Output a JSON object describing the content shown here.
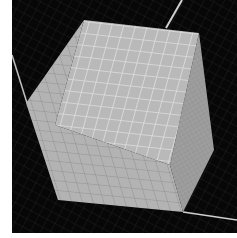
{
  "viewport": {
    "background": "#070707",
    "frame_color": "#ffffff",
    "floor_grid_color": "#1c1c1c",
    "floor_edge_color": "#bdbdbd"
  },
  "cube": {
    "grid_divisions": 10,
    "top_face": {
      "fill": "#b9b9b9",
      "grid_color": "#dedede",
      "points": "84,20 199,33 170,165 55,125"
    },
    "left_face": {
      "fill": "#b3b3b3",
      "grid_color": "#8e8e8e",
      "points": "84,20 55,125 170,165 183,212 58,200 26,103"
    },
    "right_face": {
      "fill": "#9c9c9c",
      "grid_color": "#8a8a8a",
      "points": "199,33 214,150 183,212 170,165"
    }
  }
}
